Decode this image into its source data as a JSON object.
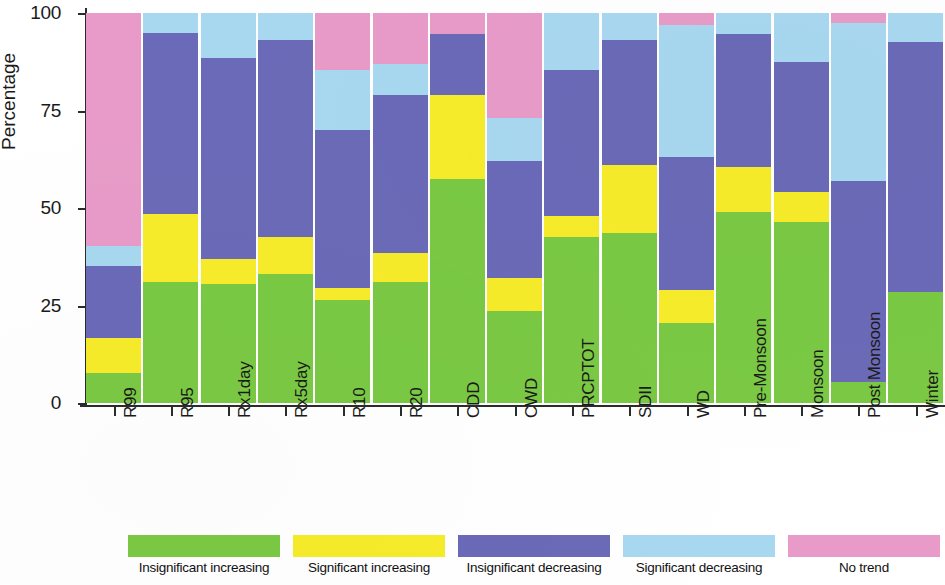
{
  "chart_data": {
    "type": "bar",
    "stacked": true,
    "title": "",
    "xlabel": "",
    "ylabel": "Percentage",
    "ylim": [
      0,
      100
    ],
    "yticks": [
      0,
      25,
      50,
      75,
      100
    ],
    "ytick_labels": [
      "0",
      "25",
      "50",
      "75",
      "100"
    ],
    "grid": false,
    "legend_position": "bottom",
    "categories": [
      "R99",
      "R95",
      "Rx1day",
      "Rx5day",
      "R10",
      "R20",
      "CDD",
      "CWD",
      "PRCPTOT",
      "SDII",
      "WD",
      "Pre-Monsoon",
      "Monsoon",
      "Post Monsoon",
      "Winter"
    ],
    "series": [
      {
        "name": "Insignificant increasing",
        "color": "#7ac943",
        "values": [
          7.7,
          31.0,
          30.5,
          33.0,
          26.5,
          31.0,
          57.5,
          23.5,
          42.5,
          43.5,
          20.5,
          49.0,
          46.5,
          5.5,
          28.5
        ]
      },
      {
        "name": "Significant increasing",
        "color": "#f7ec2a",
        "values": [
          9.0,
          17.5,
          6.5,
          9.5,
          3.0,
          7.5,
          21.5,
          8.5,
          5.5,
          17.5,
          8.5,
          11.5,
          7.5,
          0.0,
          0.0
        ]
      },
      {
        "name": "Insignificant decreasing",
        "color": "#6a6ab8",
        "values": [
          18.5,
          46.5,
          51.5,
          50.5,
          40.5,
          40.5,
          15.5,
          30.0,
          37.5,
          32.0,
          34.0,
          34.0,
          33.5,
          51.5,
          64.0
        ]
      },
      {
        "name": "Significant decreasing",
        "color": "#a8d8f0",
        "values": [
          5.0,
          5.0,
          11.5,
          7.0,
          15.5,
          8.0,
          0.0,
          11.0,
          14.5,
          7.0,
          34.0,
          5.5,
          12.5,
          40.5,
          7.5
        ]
      },
      {
        "name": "No trend",
        "color": "#e89bc8",
        "values": [
          59.8,
          0.0,
          0.0,
          0.0,
          14.5,
          13.0,
          5.5,
          27.0,
          0.0,
          0.0,
          3.0,
          0.0,
          0.0,
          2.5,
          0.0
        ]
      }
    ]
  },
  "legend": {
    "items": [
      {
        "label": "Insignificant increasing",
        "color": "#7ac943"
      },
      {
        "label": "Significant increasing",
        "color": "#f7ec2a"
      },
      {
        "label": "Insignificant decreasing",
        "color": "#6a6ab8"
      },
      {
        "label": "Significant decreasing",
        "color": "#a8d8f0"
      },
      {
        "label": "No trend",
        "color": "#e89bc8"
      }
    ]
  }
}
